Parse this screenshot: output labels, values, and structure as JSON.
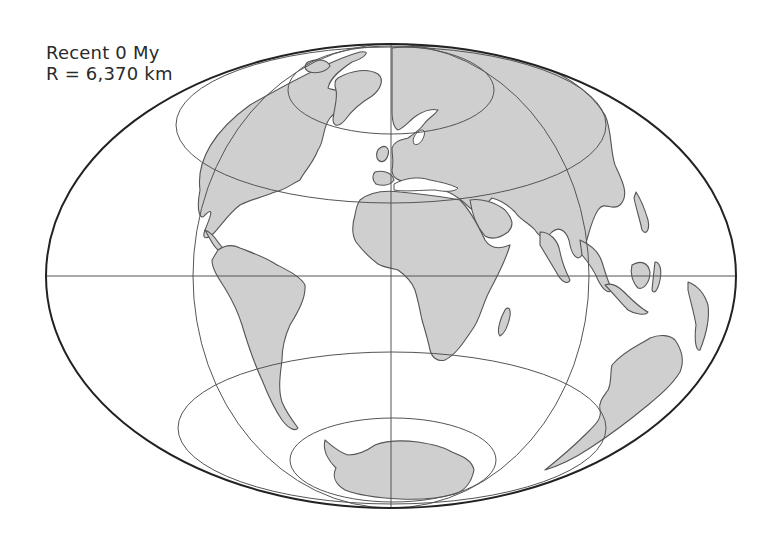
{
  "map": {
    "title": "Recent 0 My",
    "radius_label": "R = 6,370 km",
    "projection": "equal-area elliptical (Mollweide-style) world map",
    "colors": {
      "land": "#cfcfcf",
      "coastline": "#555555",
      "graticule": "#555555",
      "outline": "#222222",
      "ocean": "#ffffff"
    },
    "graticule": {
      "equator": true,
      "central_meridian": true,
      "hemisphere_limb_meridians": true,
      "northern_latitude_circles": 2,
      "southern_latitude_circles": 2
    },
    "landmasses": [
      "North America",
      "Greenland",
      "South America",
      "Europe",
      "Africa",
      "Asia",
      "Indonesia",
      "Australia",
      "Antarctica"
    ]
  }
}
